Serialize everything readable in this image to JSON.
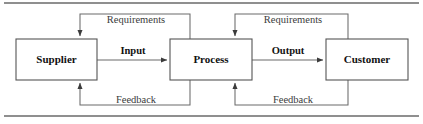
{
  "diagram": {
    "colors": {
      "box_stroke": "#555555",
      "box_fill": "#ffffff",
      "connector": "#6b6b6b",
      "text": "#111111",
      "loop_text": "#3b3b3b",
      "rule": "#6a6a6a"
    },
    "nodes": [
      {
        "id": "supplier",
        "label": "Supplier"
      },
      {
        "id": "process",
        "label": "Process"
      },
      {
        "id": "customer",
        "label": "Customer"
      }
    ],
    "flows": [
      {
        "id": "input",
        "label": "Input",
        "from": "supplier",
        "to": "process"
      },
      {
        "id": "output",
        "label": "Output",
        "from": "process",
        "to": "customer"
      }
    ],
    "loops": [
      {
        "id": "requirements-1",
        "label": "Requirements",
        "from": "process",
        "to": "supplier",
        "position": "top"
      },
      {
        "id": "requirements-2",
        "label": "Requirements",
        "from": "customer",
        "to": "process",
        "position": "top"
      },
      {
        "id": "feedback-1",
        "label": "Feedback",
        "from": "process",
        "to": "supplier",
        "position": "bottom"
      },
      {
        "id": "feedback-2",
        "label": "Feedback",
        "from": "customer",
        "to": "process",
        "position": "bottom"
      }
    ]
  }
}
